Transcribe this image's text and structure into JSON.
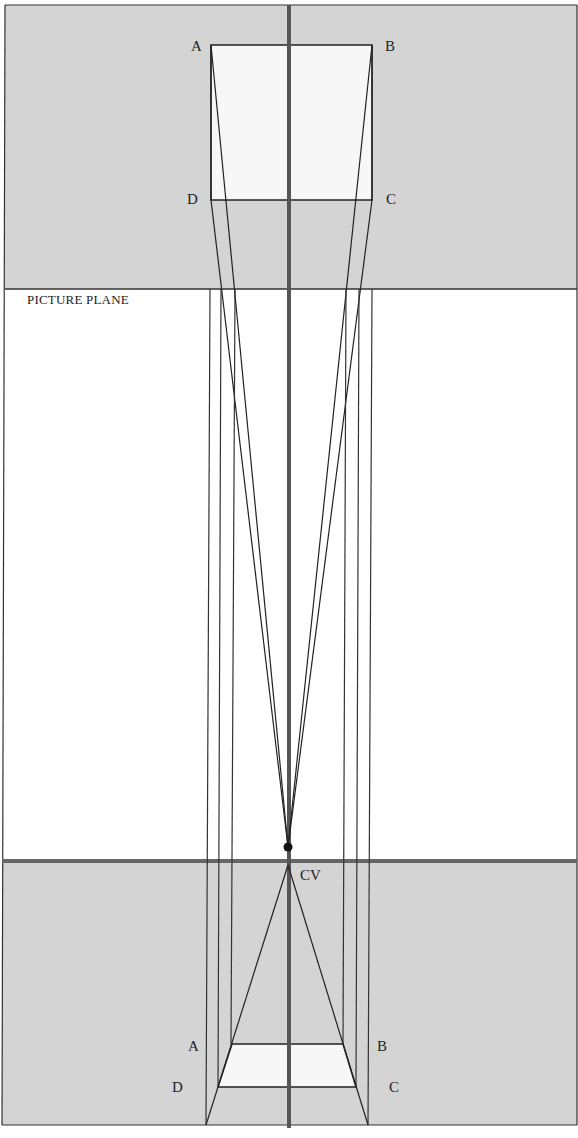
{
  "diagram": {
    "colors": {
      "ground": "#d4d4d4",
      "plane": "#f7f7f7",
      "line": "#222222",
      "axis": "#555555"
    },
    "plan_labels": {
      "a": "A",
      "b": "B",
      "c": "C",
      "d": "D"
    },
    "picture_plane_label": "PICTURE PLANE",
    "center_of_vision_label": "CV",
    "perspective_labels": {
      "a": "A",
      "b": "B",
      "c": "C",
      "d": "D"
    }
  }
}
